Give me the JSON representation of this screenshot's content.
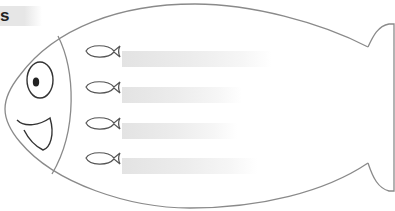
{
  "corner_label": "s",
  "worksheet": {
    "description": "Fish outline with four small fish icons and blank write-in bands",
    "stroke_color": "#8a8a8a",
    "line_color": "#333333",
    "band_color": "#e3e3e3",
    "rows": [
      {
        "icon": "small-fish-icon",
        "band": "write-in-band"
      },
      {
        "icon": "small-fish-icon",
        "band": "write-in-band"
      },
      {
        "icon": "small-fish-icon",
        "band": "write-in-band"
      },
      {
        "icon": "small-fish-icon",
        "band": "write-in-band"
      }
    ]
  }
}
